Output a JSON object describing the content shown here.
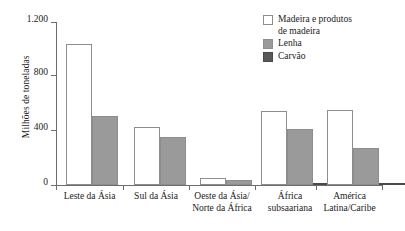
{
  "chart_data": {
    "type": "bar",
    "title": "",
    "xlabel": "",
    "ylabel": "Milhões de toneladas",
    "ylim": [
      0,
      1200
    ],
    "yticks": [
      0,
      400,
      800,
      1200
    ],
    "ytick_labels": [
      "0",
      "400",
      "800",
      "1.200"
    ],
    "grid": false,
    "legend_position": "top-right",
    "categories": [
      "Leste da Ásia",
      "Sul da Ásia",
      "Oeste da Ásia/\nNorte da África",
      "África\nsubsaariana",
      "América\nLatina/Caribe"
    ],
    "series": [
      {
        "name": "Madeira e produtos\nde madeira",
        "color": "#ffffff",
        "values": [
          1040,
          430,
          55,
          545,
          555
        ]
      },
      {
        "name": "Lenha",
        "color": "#9a9a9a",
        "values": [
          510,
          350,
          35,
          415,
          270
        ]
      },
      {
        "name": "Carvão",
        "color": "#595959",
        "values": [
          0,
          0,
          0,
          12,
          10
        ]
      }
    ]
  },
  "axis": {
    "y_title": "Milhões de toneladas",
    "y_tick_0": "0",
    "y_tick_1": "400",
    "y_tick_2": "800",
    "y_tick_3": "1.200"
  },
  "categories": {
    "c0": "Leste da Ásia",
    "c1": "Sul da Ásia",
    "c2": "Oeste da Ásia/\nNorte da África",
    "c3": "África\nsubsaariana",
    "c4": "América\nLatina/Caribe"
  },
  "legend": {
    "item0": "Madeira e produtos\nde madeira",
    "item1": "Lenha",
    "item2": "Carvão"
  }
}
